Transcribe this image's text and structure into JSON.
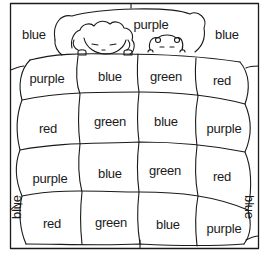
{
  "illustration": {
    "description": "Color-by-word quilt coloring page with child and teddy bear in bed",
    "line_color": "#1a1a1a",
    "background": "#ffffff"
  },
  "labels": {
    "top_left": {
      "text": "blue",
      "x": 34,
      "y": 34
    },
    "top_center": {
      "text": "purple",
      "x": 151,
      "y": 24
    },
    "top_right": {
      "text": "blue",
      "x": 227,
      "y": 34
    },
    "left_side": {
      "text": "blue",
      "x": 16,
      "y": 207
    },
    "right_side": {
      "text": "blue",
      "x": 249,
      "y": 207
    }
  },
  "quilt": {
    "rows": [
      [
        {
          "text": "purple",
          "x": 47,
          "y": 78
        },
        {
          "text": "blue",
          "x": 110,
          "y": 76
        },
        {
          "text": "green",
          "x": 166,
          "y": 76
        },
        {
          "text": "red",
          "x": 222,
          "y": 80
        }
      ],
      [
        {
          "text": "red",
          "x": 48,
          "y": 128
        },
        {
          "text": "green",
          "x": 110,
          "y": 121
        },
        {
          "text": "blue",
          "x": 166,
          "y": 121
        },
        {
          "text": "purple",
          "x": 224,
          "y": 128
        }
      ],
      [
        {
          "text": "purple",
          "x": 50,
          "y": 178
        },
        {
          "text": "blue",
          "x": 110,
          "y": 173
        },
        {
          "text": "green",
          "x": 165,
          "y": 170
        },
        {
          "text": "red",
          "x": 222,
          "y": 176
        }
      ],
      [
        {
          "text": "red",
          "x": 52,
          "y": 223
        },
        {
          "text": "green",
          "x": 111,
          "y": 222
        },
        {
          "text": "blue",
          "x": 168,
          "y": 224
        },
        {
          "text": "purple",
          "x": 224,
          "y": 228
        }
      ]
    ]
  }
}
